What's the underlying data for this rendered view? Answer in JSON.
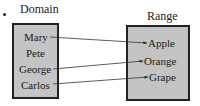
{
  "domain": {
    "title": "Domain",
    "items": [
      "Mary",
      "Pete",
      "George",
      "Carlos"
    ]
  },
  "range": {
    "title": "Range",
    "items": [
      "Apple",
      "Orange",
      "Grape"
    ]
  },
  "mappings": [
    {
      "from": "Mary",
      "to": "Apple"
    },
    {
      "from": "George",
      "to": "Orange"
    },
    {
      "from": "Carlos",
      "to": "Grape"
    }
  ],
  "colors": {
    "box_fill": "#c4c4c4",
    "border": "#222222",
    "arrow": "#333333"
  }
}
